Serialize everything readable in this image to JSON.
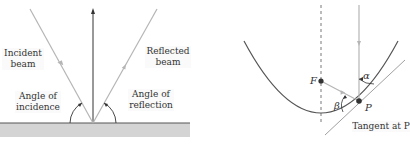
{
  "left_diagram": {
    "incident_label": [
      "Incident",
      "beam"
    ],
    "reflected_label": [
      "Reflected",
      "beam"
    ],
    "angle_incidence_label": [
      "Angle of",
      "incidence"
    ],
    "angle_reflection_label": [
      "Angle of",
      "reflection"
    ]
  },
  "right_diagram": {
    "focus_label": "F",
    "point_label": "P",
    "alpha_label": "α",
    "beta_label": "β",
    "tangent_label": "Tangent at P"
  },
  "colors": {
    "beam": "#b5b5b5",
    "surface": "#d4d4d4",
    "line": "#333333",
    "curve": "#555555"
  }
}
